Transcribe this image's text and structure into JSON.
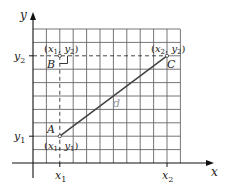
{
  "diagram": {
    "type": "distance-between-two-points",
    "axes": {
      "x_label": "x",
      "y_label": "y",
      "x_ticks": [
        {
          "label": "x",
          "sub": "1"
        },
        {
          "label": "x",
          "sub": "2"
        }
      ],
      "y_ticks": [
        {
          "label": "y",
          "sub": "2"
        },
        {
          "label": "y",
          "sub": "1"
        }
      ]
    },
    "points": {
      "A": {
        "name": "A",
        "coord_label": "(x1, y1)"
      },
      "B": {
        "name": "B",
        "coord_label": "(x1, y2)"
      },
      "C": {
        "name": "C",
        "coord_label": "(x2, y2)"
      }
    },
    "segment_label": "d",
    "colors": {
      "grid": "#555555",
      "segment": "#444444",
      "segment_label": "#999999",
      "dashed": "#333333",
      "axis": "#111111"
    }
  }
}
